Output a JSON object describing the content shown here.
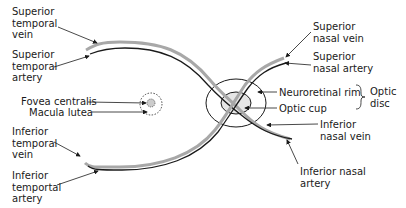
{
  "diagram": {
    "colors": {
      "vein": "#a8a8a8",
      "artery": "#1a1a1a",
      "line": "#1a1a1a",
      "fovea_fill": "#cccccc",
      "cup_fill": "#e6e6e6"
    },
    "labels": {
      "superior_temporal_vein": "Superior\ntemporal\nvein",
      "superior_temporal_artery": "Superior\ntemporal\nartery",
      "fovea_centralis": "Fovea centralis",
      "macula_lutea": "Macula lutea",
      "inferior_temporal_vein": "Inferior\ntemporal\nvein",
      "inferior_temporal_artery": "Inferior\ntemportal\nartery",
      "superior_nasal_vein": "Superior\nnasal vein",
      "superior_nasal_artery": "Superior\nnasal artery",
      "neuroretinal_rim": "Neuroretinal rim",
      "optic_cup": "Optic cup",
      "optic_disc": "Optic\ndisc",
      "inferior_nasal_vein": "Inferior\nnasal vein",
      "inferior_nasal_artery": "Inferior nasal\nartery"
    },
    "legend": {
      "vein": "grey vessel",
      "artery": "black vessel"
    }
  }
}
